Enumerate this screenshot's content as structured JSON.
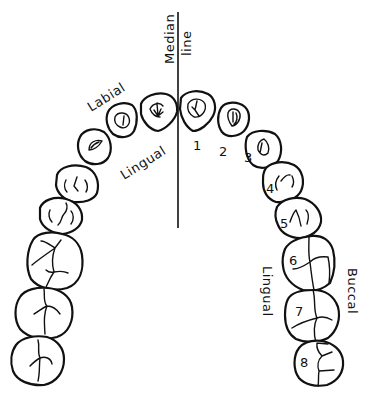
{
  "diagram": {
    "type": "dental-arch-diagram",
    "labels": {
      "median_line_1": "Median",
      "median_line_2": "line",
      "labial": "Labial",
      "lingual_front": "Lingual",
      "lingual_side": "Lingual",
      "buccal": "Buccal"
    },
    "tooth_numbers": [
      "1",
      "2",
      "3",
      "4",
      "5",
      "6",
      "7",
      "8"
    ],
    "colors": {
      "ink": "#111111",
      "background": "#ffffff"
    }
  }
}
